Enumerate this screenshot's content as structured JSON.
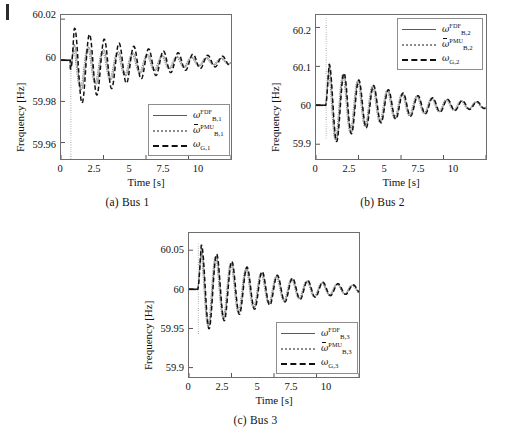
{
  "figure": {
    "panels": [
      {
        "id": "bus1",
        "caption": "(a) Bus 1",
        "xlabel": "Time [s]",
        "ylabel": "Frequency [Hz]",
        "xticks": [
          "0",
          "2.5",
          "5",
          "7.5",
          "10"
        ],
        "yticks": [
          "60.02",
          "60",
          "59.98",
          "59.96"
        ],
        "legend": [
          {
            "style": "solid",
            "omega": "ω",
            "sup": "FDF",
            "sub": "B,1",
            "overbar": false
          },
          {
            "style": "dotted",
            "omega": "ω",
            "sup": "PMU",
            "sub": "B,1",
            "overbar": true
          },
          {
            "style": "dashed",
            "omega": "ω",
            "sup": "",
            "sub": "G,1",
            "overbar": false
          }
        ]
      },
      {
        "id": "bus2",
        "caption": "(b) Bus 2",
        "xlabel": "Time [s]",
        "ylabel": "Frequency [Hz]",
        "xticks": [
          "0",
          "2.5",
          "5",
          "7.5",
          "10"
        ],
        "yticks": [
          "60.2",
          "60.1",
          "60",
          "59.9"
        ],
        "legend": [
          {
            "style": "solid",
            "omega": "ω",
            "sup": "FDF",
            "sub": "B,2",
            "overbar": false
          },
          {
            "style": "dotted",
            "omega": "ω",
            "sup": "PMU",
            "sub": "B,2",
            "overbar": true
          },
          {
            "style": "dashed",
            "omega": "ω",
            "sup": "",
            "sub": "G,2",
            "overbar": false
          }
        ]
      },
      {
        "id": "bus3",
        "caption": "(c) Bus 3",
        "xlabel": "Time [s]",
        "ylabel": "Frequency [Hz]",
        "xticks": [
          "0",
          "2.5",
          "5",
          "7.5",
          "10"
        ],
        "yticks": [
          "60.05",
          "60",
          "59.95",
          "59.9"
        ],
        "legend": [
          {
            "style": "solid",
            "omega": "ω",
            "sup": "FDF",
            "sub": "B,3",
            "overbar": false
          },
          {
            "style": "dotted",
            "omega": "ω",
            "sup": "PMU",
            "sub": "B,3",
            "overbar": true
          },
          {
            "style": "dashed",
            "omega": "ω",
            "sup": "",
            "sub": "G,3",
            "overbar": false
          }
        ]
      }
    ]
  },
  "chart_data": [
    {
      "type": "line",
      "id": "bus1",
      "title": "(a) Bus 1",
      "xlabel": "Time [s]",
      "ylabel": "Frequency [Hz]",
      "xlim": [
        0,
        10
      ],
      "ylim": [
        59.952,
        60.022
      ],
      "xticks": [
        0,
        2.5,
        5,
        7.5,
        10
      ],
      "yticks": [
        60.02,
        60,
        59.98,
        59.96
      ],
      "grid": false,
      "legend_position": "lower-right",
      "steady_state": 60,
      "event_time": 0.55,
      "oscillation_hz": 1.15,
      "damping_tau": 4.2,
      "series": [
        {
          "name": "omega_B1_FDF",
          "style": "solid",
          "color": "#5a5a5a",
          "amplitude": 0.0125,
          "phase": 0.0,
          "offset": -0.0042,
          "settle": 59.9975,
          "spike": null
        },
        {
          "name": "omega_B1_PMU",
          "style": "dotted",
          "color": "#8a8a8a",
          "amplitude": 0.0115,
          "phase": 0.55,
          "offset": -0.0042,
          "settle": 59.9975,
          "spike": {
            "t": 0.58,
            "low": 59.9505,
            "high": 60.0005
          }
        },
        {
          "name": "omega_G1",
          "style": "dashed",
          "color": "#111111",
          "amplitude": 0.0205,
          "phase": -0.3,
          "offset": -0.004,
          "settle": 59.9985,
          "spike": null
        }
      ]
    },
    {
      "type": "line",
      "id": "bus2",
      "title": "(b) Bus 2",
      "xlabel": "Time [s]",
      "ylabel": "Frequency [Hz]",
      "xlim": [
        0,
        10
      ],
      "ylim": [
        59.862,
        60.232
      ],
      "xticks": [
        0,
        2.5,
        5,
        7.5,
        10
      ],
      "yticks": [
        60.2,
        60.1,
        60,
        59.9
      ],
      "grid": false,
      "legend_position": "upper-right",
      "steady_state": 60,
      "event_time": 0.55,
      "oscillation_hz": 1.15,
      "damping_tau": 3.6,
      "series": [
        {
          "name": "omega_B2_FDF",
          "style": "solid",
          "color": "#5a5a5a",
          "amplitude": 0.108,
          "phase": 0.0,
          "offset": 0.0,
          "settle": 59.998,
          "spike": null
        },
        {
          "name": "omega_B2_PMU",
          "style": "dotted",
          "color": "#8a8a8a",
          "amplitude": 0.104,
          "phase": 0.5,
          "offset": 0.0,
          "settle": 59.997,
          "spike": {
            "t": 0.6,
            "low": 59.915,
            "high": 60.228
          }
        },
        {
          "name": "omega_G2",
          "style": "dashed",
          "color": "#111111",
          "amplitude": 0.112,
          "phase": -0.12,
          "offset": 0.0,
          "settle": 59.999,
          "spike": null
        }
      ]
    },
    {
      "type": "line",
      "id": "bus3",
      "title": "(c) Bus 3",
      "xlabel": "Time [s]",
      "ylabel": "Frequency [Hz]",
      "xlim": [
        0,
        10
      ],
      "ylim": [
        59.888,
        60.072
      ],
      "xticks": [
        0,
        2.5,
        5,
        7.5,
        10
      ],
      "yticks": [
        60.05,
        60,
        59.95,
        59.9
      ],
      "grid": false,
      "legend_position": "lower-right",
      "steady_state": 60,
      "event_time": 0.5,
      "oscillation_hz": 1.12,
      "damping_tau": 3.9,
      "series": [
        {
          "name": "omega_B3_FDF",
          "style": "solid",
          "color": "#5a5a5a",
          "amplitude": 0.056,
          "phase": 0.0,
          "offset": 0.0,
          "settle": 59.998,
          "spike": null
        },
        {
          "name": "omega_B3_PMU",
          "style": "dotted",
          "color": "#8a8a8a",
          "amplitude": 0.054,
          "phase": 0.45,
          "offset": 0.0,
          "settle": 59.997,
          "spike": {
            "t": 0.55,
            "low": 59.943,
            "high": 60.06
          }
        },
        {
          "name": "omega_G3",
          "style": "dashed",
          "color": "#111111",
          "amplitude": 0.06,
          "phase": -0.1,
          "offset": 0.0,
          "settle": 59.999,
          "spike": null
        }
      ]
    }
  ]
}
